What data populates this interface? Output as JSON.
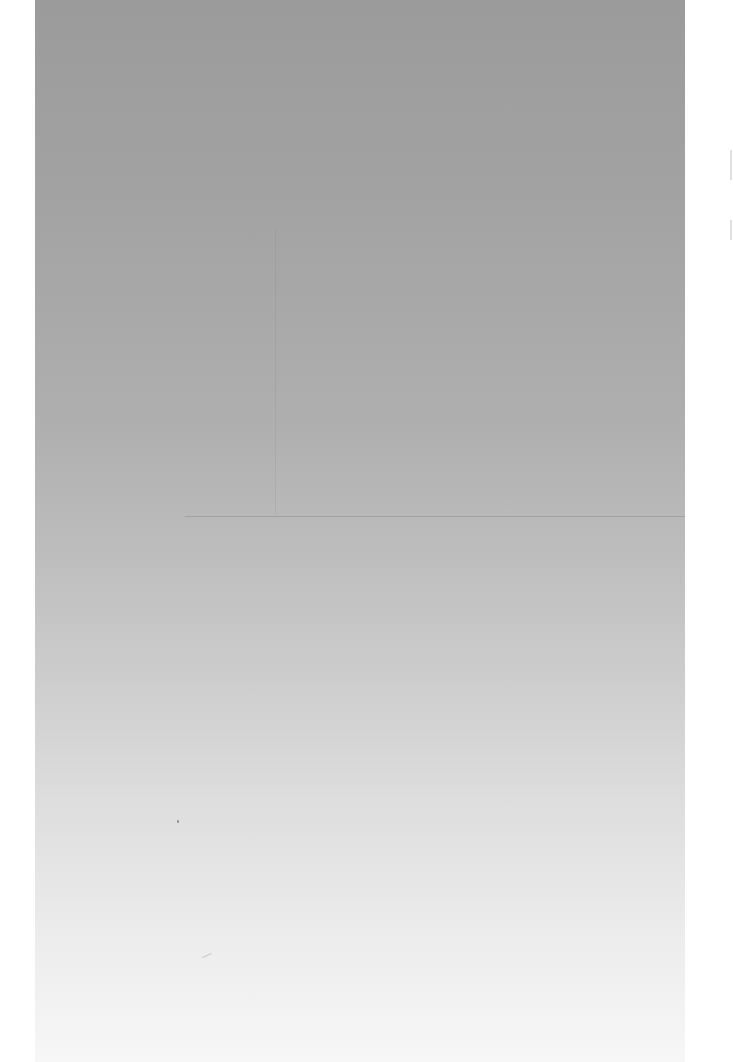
{
  "document": {
    "type": "blank scanned page",
    "text_content": "",
    "colors": {
      "top": "#9b9b9b",
      "middle": "#bdbdbd",
      "bottom": "#f7f7f7",
      "margin": "#ffffff"
    }
  }
}
